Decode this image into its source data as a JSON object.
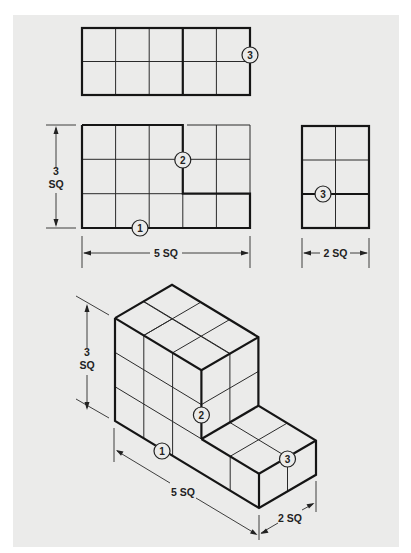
{
  "figure": {
    "top_view": {
      "callouts": [
        "3"
      ],
      "grid": {
        "cols": 5,
        "rows": 2
      }
    },
    "front_view": {
      "callouts": [
        "2",
        "1"
      ],
      "grid": {
        "cols": 5,
        "rows": 3
      },
      "height_dim": {
        "value": "3",
        "unit": "SQ"
      },
      "width_dim": "5 SQ"
    },
    "side_view": {
      "callouts": [
        "3"
      ],
      "grid": {
        "cols": 2,
        "rows": 3
      },
      "width_dim": "2 SQ"
    },
    "isometric_view": {
      "callouts": [
        "2",
        "1",
        "3"
      ],
      "height_dim": {
        "value": "3",
        "unit": "SQ"
      },
      "length_dim": "5 SQ",
      "depth_dim": "2 SQ"
    }
  }
}
